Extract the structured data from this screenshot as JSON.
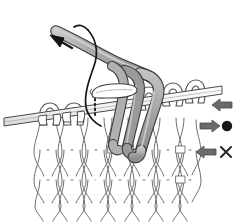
{
  "figure": {
    "kind": "knitting-technique-illustration",
    "title": "",
    "background_color": "#ffffff"
  },
  "palette": {
    "yarn_fill": "#a8a8a8",
    "yarn_fill_light": "#c4c4c4",
    "yarn_fill_dark": "#8d8d8d",
    "outline": "#3d3d3d",
    "fabric_stroke": "#6e6e6e",
    "needle_fill": "#ffffff",
    "needle_stroke": "#4a4a4a",
    "thread_black": "#1a1a1a",
    "arrow_black": "#141414",
    "legend_gray": "#3a3a3a"
  },
  "elements": {
    "working_yarn_label": "working yarn",
    "thin_thread_label": "thread loop",
    "main_needle_label": "knitting needle",
    "second_needle_label": "needle tip",
    "fabric_label": "stockinette fabric",
    "direction_arrow_label": "yarn pull direction"
  },
  "legend": {
    "rows": [
      {
        "id": "row-needle",
        "arrow_glyph": "⇐",
        "arrow_direction": "left",
        "arrow_style": "outline-double",
        "mark": "",
        "mark_type": "none"
      },
      {
        "id": "row-dot",
        "arrow_glyph": "⇒",
        "arrow_direction": "right",
        "arrow_style": "outline-double",
        "mark": "●",
        "mark_type": "dot"
      },
      {
        "id": "row-cross",
        "arrow_glyph": "⇐",
        "arrow_direction": "left",
        "arrow_style": "outline-double",
        "mark": "×",
        "mark_type": "cross"
      }
    ]
  }
}
